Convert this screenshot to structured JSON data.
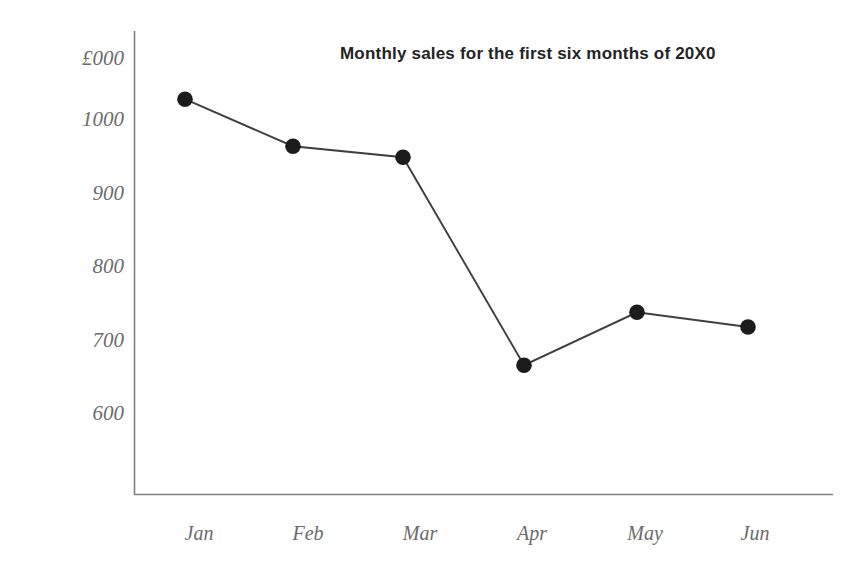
{
  "chart_data": {
    "type": "line",
    "title": "Monthly sales for the first six months of 20X0",
    "xlabel": "",
    "ylabel": "£000",
    "categories": [
      "Jan",
      "Feb",
      "Mar",
      "Apr",
      "May",
      "Jun"
    ],
    "values": [
      1027,
      963,
      948,
      665,
      737,
      717
    ],
    "series": [
      {
        "name": "Monthly sales",
        "values": [
          1027,
          963,
          948,
          665,
          737,
          717
        ]
      }
    ],
    "y_ticks": [
      1000,
      900,
      800,
      700,
      600
    ],
    "y_tick_labels": [
      "1000",
      "900",
      "800",
      "700",
      "600"
    ],
    "ylim": [
      540,
      1050
    ],
    "grid": false,
    "legend": "none",
    "marker": "filled-circle",
    "line_color": "#3f3f3f",
    "marker_color": "#1c1c1c",
    "axis_color": "#808080",
    "label_color": "#6b6b6b",
    "title_color": "#232323"
  },
  "axis": {
    "unit_label": "£000"
  }
}
